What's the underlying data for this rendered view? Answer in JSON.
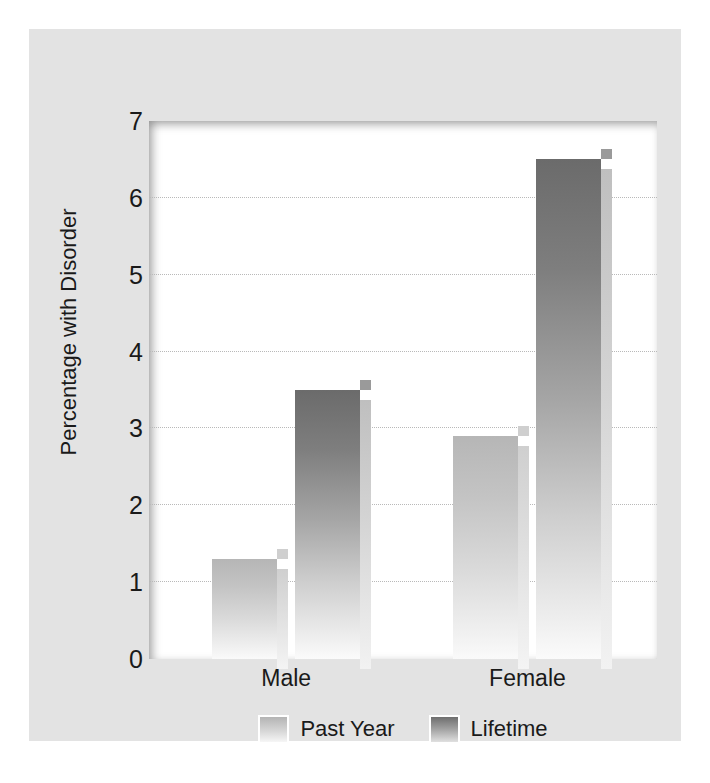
{
  "chart_data": {
    "type": "bar",
    "title": "",
    "subtitle": "",
    "xlabel": "",
    "ylabel": "Percentage with Disorder",
    "categories": [
      "Male",
      "Female"
    ],
    "series": [
      {
        "name": "Past Year",
        "values": [
          1.3,
          2.9
        ],
        "color": "#c4c4c4"
      },
      {
        "name": "Lifetime",
        "values": [
          3.5,
          6.5
        ],
        "color": "#7e7e7e"
      }
    ],
    "ylim": [
      0,
      7
    ],
    "yticks": [
      0,
      1,
      2,
      3,
      4,
      5,
      6,
      7
    ],
    "ytick_labels": [
      "0",
      "1",
      "2",
      "3",
      "4",
      "5",
      "6",
      "7"
    ],
    "grid": true,
    "grid_style": "dotted",
    "legend_position": "bottom-center",
    "style_3d": true
  },
  "colors": {
    "panel_background": "#e3e3e3",
    "plot_background": "#ffffff",
    "page_background": "#ffffff",
    "gridline": "#b9b9b9",
    "text": "#1a1a1a"
  }
}
